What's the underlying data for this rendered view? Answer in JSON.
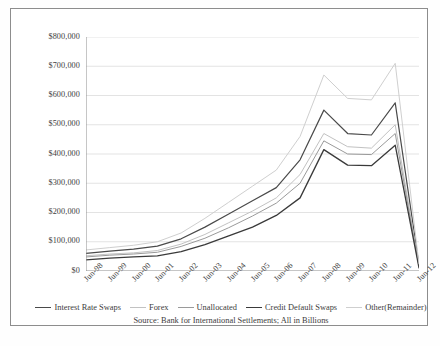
{
  "chart_data": {
    "type": "line",
    "title": "",
    "subtitle": "",
    "xlabel": "",
    "ylabel": "",
    "source_note": "Source: Bank for International Settlements; All in Billions",
    "grid": true,
    "legend_position": "bottom",
    "ylim": [
      0,
      800000
    ],
    "ytick_step": 100000,
    "ytick_labels": [
      "$800,000",
      "$700,000",
      "$600,000",
      "$500,000",
      "$400,000",
      "$300,000",
      "$200,000",
      "$100,000",
      "$0"
    ],
    "ytick_values": [
      800000,
      700000,
      600000,
      500000,
      400000,
      300000,
      200000,
      100000,
      0
    ],
    "categories": [
      "Jun-98",
      "Jun-99",
      "Jun-00",
      "Jun-01",
      "Jun-02",
      "Jun-03",
      "Jun-04",
      "Jun-05",
      "Jun-06",
      "Jun-07",
      "Jun-08",
      "Jun-09",
      "Jun-10",
      "Jun-11",
      "Jun-12"
    ],
    "xtick_labels": [
      "Jun-98",
      "Jun-99",
      "Jun-00",
      "Jun-01",
      "Jun-02",
      "Jun-03",
      "Jun-04",
      "Jun-05",
      "Jun-06",
      "Jun-07",
      "Jun-08",
      "Jun-09",
      "Jun-10",
      "Jun-11",
      "Jun-12"
    ],
    "minor_ticks_per_interval": 2,
    "series": [
      {
        "name": "Interest Rate Swaps",
        "color": "#4a4a4a",
        "width": 1.2,
        "values": [
          60000,
          68000,
          75000,
          85000,
          110000,
          150000,
          195000,
          240000,
          285000,
          380000,
          550000,
          470000,
          465000,
          575000,
          20000
        ]
      },
      {
        "name": "Forex",
        "color": "#c2c2c2",
        "width": 1.0,
        "values": [
          52000,
          58000,
          62000,
          70000,
          92000,
          125000,
          165000,
          205000,
          250000,
          330000,
          470000,
          425000,
          420000,
          500000,
          16000
        ]
      },
      {
        "name": "Unallocated",
        "color": "#9a9a9a",
        "width": 1.0,
        "values": [
          48000,
          54000,
          58000,
          64000,
          84000,
          112000,
          148000,
          188000,
          232000,
          300000,
          445000,
          400000,
          398000,
          470000,
          14000
        ]
      },
      {
        "name": "Credit Default Swaps",
        "color": "#3a3a3a",
        "width": 1.3,
        "values": [
          38000,
          44000,
          48000,
          52000,
          66000,
          90000,
          120000,
          150000,
          190000,
          250000,
          415000,
          362000,
          360000,
          430000,
          11000
        ]
      },
      {
        "name": "Other(Remainder)",
        "color": "#cfcfcf",
        "width": 1.0,
        "values": [
          72000,
          80000,
          88000,
          100000,
          130000,
          180000,
          235000,
          290000,
          345000,
          460000,
          670000,
          590000,
          585000,
          710000,
          24000
        ]
      }
    ]
  }
}
